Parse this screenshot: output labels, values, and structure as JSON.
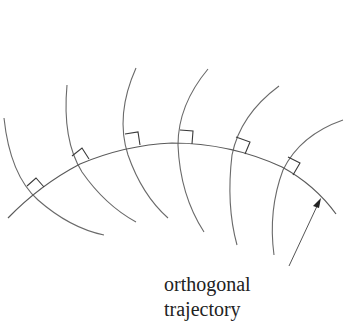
{
  "diagram": {
    "title": "Orthogonal trajectory",
    "label_line1": "orthogonal",
    "label_line2": "trajectory",
    "curve_family_count": 6,
    "colors": {
      "curves": "#6a6a6a",
      "trajectory": "#5a5a5a",
      "text": "#222222"
    }
  }
}
